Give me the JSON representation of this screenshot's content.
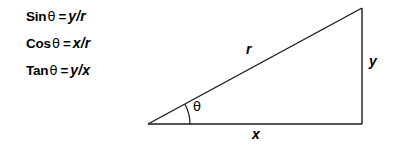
{
  "figure": {
    "background_color": "#ffffff",
    "stroke_color": "#1a1a1a",
    "text_color": "#000000"
  },
  "equations": [
    {
      "id": "sine",
      "function": "Sin",
      "angle": "θ",
      "equals": "=",
      "ratio": "y/r",
      "numerator": "y",
      "denominator": "r"
    },
    {
      "id": "cosine",
      "function": "Cos",
      "angle": "θ",
      "equals": "=",
      "ratio": "x/r",
      "numerator": "x",
      "denominator": "r"
    },
    {
      "id": "tangent",
      "function": "Tan",
      "angle": "θ",
      "equals": "=",
      "ratio": "y/x",
      "numerator": "y",
      "denominator": "x"
    }
  ],
  "triangle": {
    "labels": {
      "hypotenuse": "r",
      "opposite": "y",
      "adjacent": "x",
      "angle": "θ"
    },
    "vertices": {
      "origin": [
        148,
        124
      ],
      "bottom_right": [
        362,
        124
      ],
      "top_right": [
        362,
        8
      ]
    },
    "angle_arc": {
      "center": [
        148,
        124
      ],
      "radius": 42
    }
  }
}
